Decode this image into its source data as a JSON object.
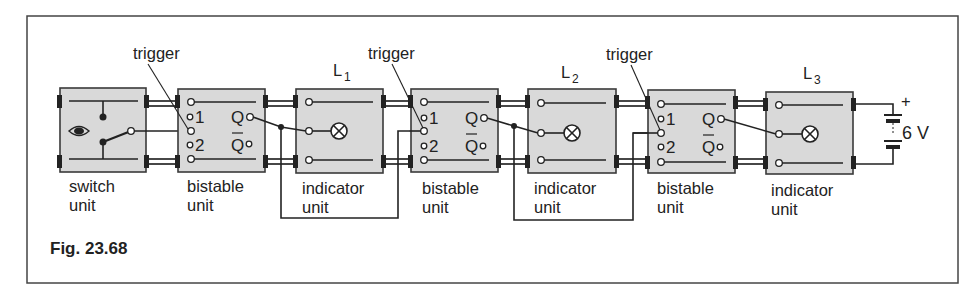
{
  "figure": {
    "caption": "Fig. 23.68"
  },
  "units": [
    {
      "type": "switch",
      "label_line1": "switch",
      "label_line2": "unit"
    },
    {
      "type": "bistable",
      "label_line1": "bistable",
      "label_line2": "unit",
      "trigger_label": "trigger",
      "pin1": "1",
      "pin2": "2",
      "out_q": "Q",
      "out_qbar": "Q"
    },
    {
      "type": "indicator",
      "label_line1": "indicator",
      "label_line2": "unit",
      "lamp_label": "L",
      "lamp_sub": "1"
    },
    {
      "type": "bistable",
      "label_line1": "bistable",
      "label_line2": "unit",
      "trigger_label": "trigger",
      "pin1": "1",
      "pin2": "2",
      "out_q": "Q",
      "out_qbar": "Q"
    },
    {
      "type": "indicator",
      "label_line1": "indicator",
      "label_line2": "unit",
      "lamp_label": "L",
      "lamp_sub": "2"
    },
    {
      "type": "bistable",
      "label_line1": "bistable",
      "label_line2": "unit",
      "trigger_label": "trigger",
      "pin1": "1",
      "pin2": "2",
      "out_q": "Q",
      "out_qbar": "Q"
    },
    {
      "type": "indicator",
      "label_line1": "indicator",
      "label_line2": "unit",
      "lamp_label": "L",
      "lamp_sub": "3"
    }
  ],
  "supply": {
    "voltage_label": "6 V",
    "positive_label": "+"
  },
  "colors": {
    "unit_fill": "#d9d9d9",
    "ink": "#222222",
    "background": "#ffffff"
  }
}
